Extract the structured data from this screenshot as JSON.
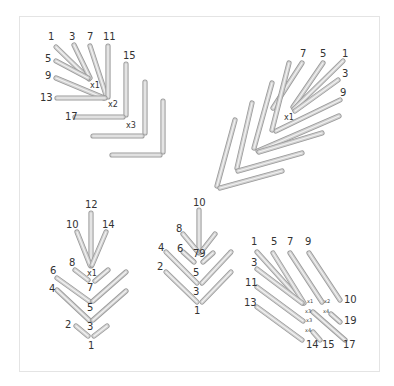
{
  "figure": {
    "colors": {
      "stick_fill": "#d0d0d0",
      "stick_outline": "#9a9a9a",
      "stick_highlight": "#f2f2f2",
      "label": "#333333",
      "frame": "#e4e4e4"
    }
  },
  "panels": [
    {
      "name": "top-left",
      "sticks": [
        {
          "x1": 56,
          "y1": 47,
          "x2": 89,
          "y2": 79
        },
        {
          "x1": 74,
          "y1": 45,
          "x2": 90,
          "y2": 78
        },
        {
          "x1": 90,
          "y1": 46,
          "x2": 106,
          "y2": 95
        },
        {
          "x1": 108,
          "y1": 46,
          "x2": 108,
          "y2": 97
        },
        {
          "x1": 56,
          "y1": 61,
          "x2": 88,
          "y2": 78
        },
        {
          "x1": 56,
          "y1": 78,
          "x2": 104,
          "y2": 98
        },
        {
          "x1": 57,
          "y1": 98,
          "x2": 105,
          "y2": 98
        },
        {
          "x1": 126,
          "y1": 64,
          "x2": 126,
          "y2": 115
        },
        {
          "x1": 75,
          "y1": 117,
          "x2": 123,
          "y2": 117
        },
        {
          "x1": 145,
          "y1": 82,
          "x2": 145,
          "y2": 133
        },
        {
          "x1": 93,
          "y1": 136,
          "x2": 142,
          "y2": 136
        },
        {
          "x1": 163,
          "y1": 101,
          "x2": 163,
          "y2": 152
        },
        {
          "x1": 112,
          "y1": 155,
          "x2": 160,
          "y2": 155
        }
      ],
      "labels": [
        {
          "t": "1",
          "x": 48,
          "y": 40,
          "c": "lbl"
        },
        {
          "t": "3",
          "x": 69,
          "y": 40,
          "c": "lbl"
        },
        {
          "t": "7",
          "x": 87,
          "y": 40,
          "c": "lbl"
        },
        {
          "t": "11",
          "x": 103,
          "y": 40,
          "c": "lbl"
        },
        {
          "t": "5",
          "x": 45,
          "y": 62,
          "c": "lbl"
        },
        {
          "t": "9",
          "x": 45,
          "y": 79,
          "c": "lbl"
        },
        {
          "t": "13",
          "x": 40,
          "y": 101,
          "c": "lbl"
        },
        {
          "t": "15",
          "x": 123,
          "y": 59,
          "c": "lbl"
        },
        {
          "t": "17",
          "x": 65,
          "y": 120,
          "c": "lbl"
        },
        {
          "t": "x1",
          "x": 90,
          "y": 88,
          "c": "xl"
        },
        {
          "t": "x2",
          "x": 108,
          "y": 107,
          "c": "xl"
        },
        {
          "t": "x3",
          "x": 126,
          "y": 128,
          "c": "xl"
        }
      ]
    },
    {
      "name": "top-right",
      "sticks": [
        {
          "x1": 302,
          "y1": 63,
          "x2": 273,
          "y2": 108
        },
        {
          "x1": 323,
          "y1": 63,
          "x2": 293,
          "y2": 107
        },
        {
          "x1": 343,
          "y1": 61,
          "x2": 294,
          "y2": 109
        },
        {
          "x1": 338,
          "y1": 80,
          "x2": 295,
          "y2": 111
        },
        {
          "x1": 340,
          "y1": 100,
          "x2": 276,
          "y2": 131
        },
        {
          "x1": 289,
          "y1": 63,
          "x2": 272,
          "y2": 130
        },
        {
          "x1": 272,
          "y1": 83,
          "x2": 254,
          "y2": 148
        },
        {
          "x1": 339,
          "y1": 116,
          "x2": 258,
          "y2": 151
        },
        {
          "x1": 322,
          "y1": 133,
          "x2": 259,
          "y2": 152
        },
        {
          "x1": 252,
          "y1": 103,
          "x2": 237,
          "y2": 168
        },
        {
          "x1": 302,
          "y1": 153,
          "x2": 238,
          "y2": 171
        },
        {
          "x1": 235,
          "y1": 120,
          "x2": 217,
          "y2": 186
        },
        {
          "x1": 282,
          "y1": 171,
          "x2": 220,
          "y2": 188
        }
      ],
      "labels": [
        {
          "t": "7",
          "x": 300,
          "y": 57,
          "c": "lbl"
        },
        {
          "t": "5",
          "x": 320,
          "y": 57,
          "c": "lbl"
        },
        {
          "t": "1",
          "x": 342,
          "y": 57,
          "c": "lbl"
        },
        {
          "t": "3",
          "x": 342,
          "y": 77,
          "c": "lbl"
        },
        {
          "t": "9",
          "x": 340,
          "y": 96,
          "c": "lbl"
        },
        {
          "t": "x1",
          "x": 284,
          "y": 120,
          "c": "xl"
        }
      ]
    },
    {
      "name": "bottom-left",
      "sticks": [
        {
          "x1": 91,
          "y1": 213,
          "x2": 91,
          "y2": 266
        },
        {
          "x1": 77,
          "y1": 232,
          "x2": 90,
          "y2": 265
        },
        {
          "x1": 106,
          "y1": 232,
          "x2": 92,
          "y2": 265
        },
        {
          "x1": 75,
          "y1": 270,
          "x2": 88,
          "y2": 280
        },
        {
          "x1": 108,
          "y1": 270,
          "x2": 95,
          "y2": 281
        },
        {
          "x1": 57,
          "y1": 278,
          "x2": 89,
          "y2": 301
        },
        {
          "x1": 126,
          "y1": 272,
          "x2": 93,
          "y2": 301
        },
        {
          "x1": 57,
          "y1": 290,
          "x2": 89,
          "y2": 320
        },
        {
          "x1": 126,
          "y1": 291,
          "x2": 93,
          "y2": 320
        },
        {
          "x1": 76,
          "y1": 326,
          "x2": 88,
          "y2": 336
        },
        {
          "x1": 107,
          "y1": 326,
          "x2": 94,
          "y2": 336
        }
      ],
      "labels": [
        {
          "t": "12",
          "x": 85,
          "y": 208,
          "c": "lbl"
        },
        {
          "t": "10",
          "x": 66,
          "y": 228,
          "c": "lbl"
        },
        {
          "t": "14",
          "x": 102,
          "y": 228,
          "c": "lbl"
        },
        {
          "t": "8",
          "x": 69,
          "y": 266,
          "c": "lbl"
        },
        {
          "t": "x1",
          "x": 87,
          "y": 276,
          "c": "xl"
        },
        {
          "t": "6",
          "x": 50,
          "y": 274,
          "c": "lbl"
        },
        {
          "t": "7",
          "x": 87,
          "y": 291,
          "c": "lbl"
        },
        {
          "t": "4",
          "x": 49,
          "y": 292,
          "c": "lbl"
        },
        {
          "t": "5",
          "x": 87,
          "y": 311,
          "c": "lbl"
        },
        {
          "t": "3",
          "x": 87,
          "y": 330,
          "c": "lbl"
        },
        {
          "t": "2",
          "x": 65,
          "y": 328,
          "c": "lbl"
        },
        {
          "t": "1",
          "x": 88,
          "y": 349,
          "c": "lbl"
        }
      ]
    },
    {
      "name": "bottom-middle",
      "sticks": [
        {
          "x1": 199,
          "y1": 210,
          "x2": 199,
          "y2": 253
        },
        {
          "x1": 183,
          "y1": 234,
          "x2": 198,
          "y2": 252
        },
        {
          "x1": 215,
          "y1": 234,
          "x2": 201,
          "y2": 252
        },
        {
          "x1": 183,
          "y1": 252,
          "x2": 194,
          "y2": 262
        },
        {
          "x1": 213,
          "y1": 253,
          "x2": 203,
          "y2": 262
        },
        {
          "x1": 166,
          "y1": 252,
          "x2": 197,
          "y2": 283
        },
        {
          "x1": 231,
          "y1": 252,
          "x2": 202,
          "y2": 283
        },
        {
          "x1": 166,
          "y1": 272,
          "x2": 197,
          "y2": 302
        },
        {
          "x1": 231,
          "y1": 272,
          "x2": 202,
          "y2": 302
        }
      ],
      "labels": [
        {
          "t": "10",
          "x": 193,
          "y": 206,
          "c": "lbl"
        },
        {
          "t": "8",
          "x": 176,
          "y": 232,
          "c": "lbl"
        },
        {
          "t": "6",
          "x": 177,
          "y": 252,
          "c": "lbl"
        },
        {
          "t": "79",
          "x": 193,
          "y": 257,
          "c": "lbl"
        },
        {
          "t": "4",
          "x": 158,
          "y": 251,
          "c": "lbl"
        },
        {
          "t": "5",
          "x": 193,
          "y": 276,
          "c": "lbl"
        },
        {
          "t": "2",
          "x": 157,
          "y": 270,
          "c": "lbl"
        },
        {
          "t": "3",
          "x": 193,
          "y": 295,
          "c": "lbl"
        },
        {
          "t": "1",
          "x": 194,
          "y": 314,
          "c": "lbl"
        }
      ]
    },
    {
      "name": "bottom-right",
      "sticks": [
        {
          "x1": 257,
          "y1": 252,
          "x2": 303,
          "y2": 303
        },
        {
          "x1": 273,
          "y1": 253,
          "x2": 304,
          "y2": 303
        },
        {
          "x1": 290,
          "y1": 253,
          "x2": 322,
          "y2": 302
        },
        {
          "x1": 309,
          "y1": 253,
          "x2": 340,
          "y2": 300
        },
        {
          "x1": 257,
          "y1": 269,
          "x2": 302,
          "y2": 303
        },
        {
          "x1": 257,
          "y1": 287,
          "x2": 303,
          "y2": 321
        },
        {
          "x1": 257,
          "y1": 307,
          "x2": 302,
          "y2": 340
        },
        {
          "x1": 313,
          "y1": 312,
          "x2": 345,
          "y2": 340
        },
        {
          "x1": 331,
          "y1": 314,
          "x2": 340,
          "y2": 322
        },
        {
          "x1": 313,
          "y1": 332,
          "x2": 320,
          "y2": 340
        }
      ],
      "labels": [
        {
          "t": "1",
          "x": 251,
          "y": 245,
          "c": "lbl"
        },
        {
          "t": "5",
          "x": 271,
          "y": 245,
          "c": "lbl"
        },
        {
          "t": "7",
          "x": 287,
          "y": 245,
          "c": "lbl"
        },
        {
          "t": "9",
          "x": 305,
          "y": 245,
          "c": "lbl"
        },
        {
          "t": "3",
          "x": 251,
          "y": 266,
          "c": "lbl"
        },
        {
          "t": "11",
          "x": 245,
          "y": 286,
          "c": "lbl"
        },
        {
          "t": "13",
          "x": 244,
          "y": 306,
          "c": "lbl"
        },
        {
          "t": "x1",
          "x": 307,
          "y": 303,
          "c": "xs"
        },
        {
          "t": "x2",
          "x": 324,
          "y": 303,
          "c": "xs"
        },
        {
          "t": "10",
          "x": 344,
          "y": 303,
          "c": "lbl"
        },
        {
          "t": "x3",
          "x": 305,
          "y": 313,
          "c": "xs"
        },
        {
          "t": "x4",
          "x": 323,
          "y": 313,
          "c": "xs"
        },
        {
          "t": "19",
          "x": 344,
          "y": 324,
          "c": "lbl"
        },
        {
          "t": "x3",
          "x": 306,
          "y": 322,
          "c": "xs"
        },
        {
          "t": "x4",
          "x": 305,
          "y": 332,
          "c": "xs"
        },
        {
          "t": "14",
          "x": 306,
          "y": 348,
          "c": "lbl"
        },
        {
          "t": "15",
          "x": 322,
          "y": 348,
          "c": "lbl"
        },
        {
          "t": "17",
          "x": 343,
          "y": 348,
          "c": "lbl"
        }
      ]
    }
  ]
}
